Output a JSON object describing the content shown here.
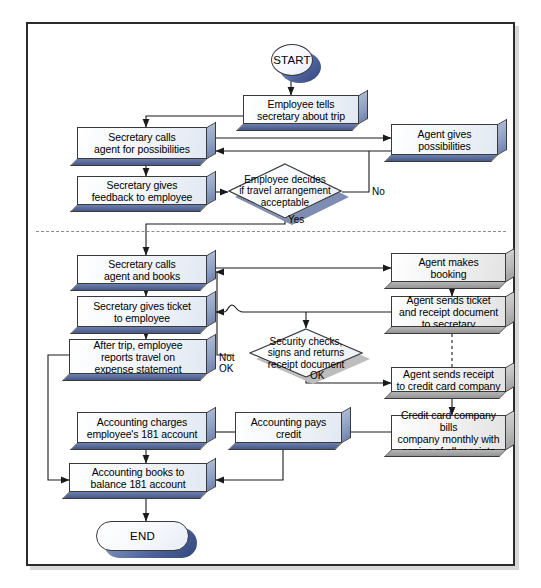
{
  "diagram": {
    "colors": {
      "box_fill": "#f1f5fa",
      "box_side_blue": "#8fa0c4",
      "box_bottom_blue": "#46588a",
      "box_side_gray": "#b9b9b9",
      "outline": "#3a3a3a",
      "frame": "#2b2b2b",
      "separator": "#8b8b8b"
    },
    "separator_style": "dash-dot"
  },
  "nodes": {
    "start": {
      "label": "START",
      "shape": "circle-terminator"
    },
    "end": {
      "label": "END",
      "shape": "pill-terminator"
    },
    "employee_tells": {
      "label": "Employee tells\nsecretary about trip",
      "shape": "process"
    },
    "secretary_calls_possibilities": {
      "label": "Secretary calls\nagent for possibilities",
      "shape": "process"
    },
    "agent_gives_possibilities": {
      "label": "Agent gives\npossibilities",
      "shape": "process"
    },
    "secretary_feedback": {
      "label": "Secretary gives\nfeedback to employee",
      "shape": "process"
    },
    "employee_decides": {
      "label": "Employee decides\nif travel arrangement\nacceptable",
      "shape": "decision"
    },
    "secretary_books": {
      "label": "Secretary calls\nagent and books",
      "shape": "process"
    },
    "agent_makes_booking": {
      "label": "Agent makes\nbooking",
      "shape": "process"
    },
    "secretary_gives_ticket": {
      "label": "Secretary gives ticket\nto employee",
      "shape": "process"
    },
    "agent_sends_ticket": {
      "label": "Agent sends ticket\nand receipt document\nto secretary",
      "shape": "process"
    },
    "after_trip": {
      "label": "After trip, employee\nreports travel on\nexpense statement",
      "shape": "process"
    },
    "security_checks": {
      "label": "Security checks,\nsigns and returns\nreceipt document",
      "shape": "decision"
    },
    "agent_sends_receipt": {
      "label": "Agent sends receipt\nto credit card company",
      "shape": "process"
    },
    "accounting_charges": {
      "label": "Accounting charges\nemployee's 181 account",
      "shape": "process"
    },
    "accounting_pays": {
      "label": "Accounting pays credit",
      "shape": "process"
    },
    "credit_card_bills": {
      "label": "Credit card company bills\ncompany monthly with\ncopies of all receipts",
      "shape": "process"
    },
    "accounting_books": {
      "label": "Accounting books to\nbalance 181 account",
      "shape": "process"
    }
  },
  "edge_labels": {
    "no": "No",
    "yes": "Yes",
    "not_ok": "Not\nOK",
    "ok": "OK"
  }
}
